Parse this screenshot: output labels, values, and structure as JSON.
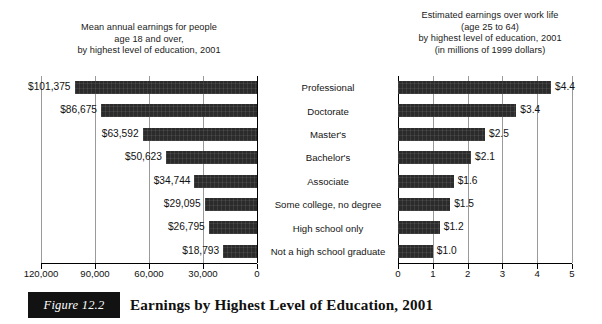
{
  "figure": {
    "number_label": "Figure 12.2",
    "caption": "Earnings by Highest Level of Education, 2001"
  },
  "colors": {
    "bar": "#2b2b2b",
    "gridline": "#9a9a9a",
    "axis": "#000000",
    "text": "#111111",
    "caption_box_bg": "#121212",
    "caption_box_text": "#ffffff",
    "background": "#ffffff"
  },
  "categories": [
    "Professional",
    "Doctorate",
    "Master's",
    "Bachelor's",
    "Associate",
    "Some college, no degree",
    "High school only",
    "Not a high school graduate"
  ],
  "left_panel": {
    "title": "Mean annual earnings for people\nage 18 and over,\nby highest level of education, 2001",
    "axis_tick_labels": [
      "120,000",
      "90,000",
      "60,000",
      "30,000",
      "0"
    ],
    "value_labels": [
      "$101,375",
      "$86,675",
      "$63,592",
      "$50,623",
      "$34,744",
      "$29,095",
      "$26,795",
      "$18,793"
    ]
  },
  "right_panel": {
    "title": "Estimated earnings over work life\n(age 25 to 64)\nby highest level of education, 2001\n(in millions of 1999 dollars)",
    "axis_tick_labels": [
      "0",
      "1",
      "2",
      "3",
      "4",
      "5"
    ],
    "value_labels": [
      "$4.4",
      "$3.4",
      "$2.5",
      "$2.1",
      "$1.6",
      "$1.5",
      "$1.2",
      "$1.0"
    ]
  },
  "chart_data": [
    {
      "type": "bar",
      "orientation": "horizontal-reversed",
      "title": "Mean annual earnings for people age 18 and over, by highest level of education, 2001",
      "xlabel": "",
      "ylabel": "",
      "categories": [
        "Professional",
        "Doctorate",
        "Master's",
        "Bachelor's",
        "Associate",
        "Some college, no degree",
        "High school only",
        "Not a high school graduate"
      ],
      "values": [
        101375,
        86675,
        63592,
        50623,
        34744,
        29095,
        26795,
        18793
      ],
      "data_labels": [
        "$101,375",
        "$86,675",
        "$63,592",
        "$50,623",
        "$34,744",
        "$29,095",
        "$26,795",
        "$18,793"
      ],
      "xlim": [
        0,
        120000
      ],
      "xticks": [
        120000,
        90000,
        60000,
        30000,
        0
      ],
      "xtick_labels": [
        "120,000",
        "90,000",
        "60,000",
        "30,000",
        "0"
      ],
      "grid": true,
      "legend": "none",
      "units": "US dollars"
    },
    {
      "type": "bar",
      "orientation": "horizontal",
      "title": "Estimated earnings over work life (age 25 to 64) by highest level of education, 2001 (in millions of 1999 dollars)",
      "xlabel": "",
      "ylabel": "",
      "categories": [
        "Professional",
        "Doctorate",
        "Master's",
        "Bachelor's",
        "Associate",
        "Some college, no degree",
        "High school only",
        "Not a high school graduate"
      ],
      "values": [
        4.4,
        3.4,
        2.5,
        2.1,
        1.6,
        1.5,
        1.2,
        1.0
      ],
      "data_labels": [
        "$4.4",
        "$3.4",
        "$2.5",
        "$2.1",
        "$1.6",
        "$1.5",
        "$1.2",
        "$1.0"
      ],
      "xlim": [
        0,
        5
      ],
      "xticks": [
        0,
        1,
        2,
        3,
        4,
        5
      ],
      "xtick_labels": [
        "0",
        "1",
        "2",
        "3",
        "4",
        "5"
      ],
      "grid": true,
      "legend": "none",
      "units": "millions of 1999 dollars"
    }
  ]
}
